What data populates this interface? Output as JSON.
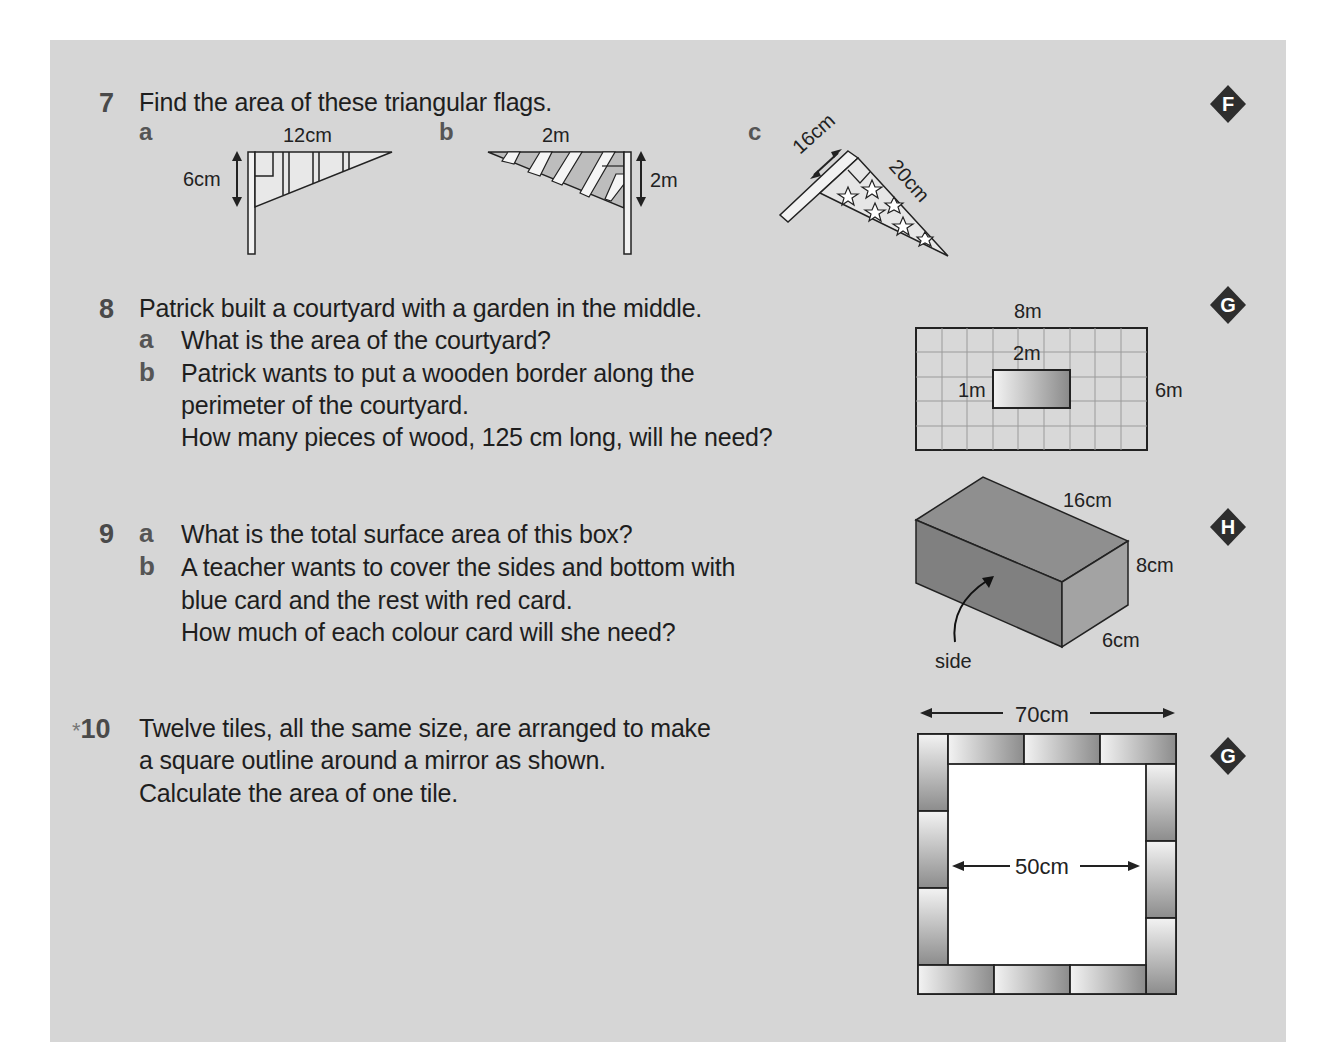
{
  "questions": {
    "q7": {
      "number": "7",
      "text": "Find the area of these triangular flags.",
      "difficulty": "F",
      "parts": {
        "a": {
          "label": "a",
          "width": "12cm",
          "height": "6cm"
        },
        "b": {
          "label": "b",
          "width": "2m",
          "height": "2m"
        },
        "c": {
          "label": "c",
          "side1": "16cm",
          "side2": "20cm"
        }
      }
    },
    "q8": {
      "number": "8",
      "text": "Patrick built a courtyard with a garden in the middle.",
      "difficulty": "G",
      "parts": [
        {
          "label": "a",
          "lines": [
            "What is the area of the courtyard?"
          ]
        },
        {
          "label": "b",
          "lines": [
            "Patrick wants to put a wooden border along the",
            "perimeter of the courtyard.",
            "How many pieces of wood, 125 cm long, will he need?"
          ]
        }
      ],
      "diagram": {
        "courtyard_width": "8m",
        "courtyard_height": "6m",
        "garden_width": "2m",
        "garden_height": "1m"
      }
    },
    "q9": {
      "number": "9",
      "difficulty": "H",
      "parts": [
        {
          "label": "a",
          "lines": [
            "What is the total surface area of this box?"
          ]
        },
        {
          "label": "b",
          "lines": [
            "A teacher wants to cover the sides and bottom with",
            "blue card and the rest with red card.",
            "How much of each colour card will she need?"
          ]
        }
      ],
      "diagram": {
        "length": "16cm",
        "height": "8cm",
        "depth": "6cm",
        "side_label": "side"
      }
    },
    "q10": {
      "number": "10",
      "star": "*",
      "difficulty": "G",
      "lines": [
        "Twelve tiles, all the same size, are arranged to make",
        "a square outline around a mirror as shown.",
        "Calculate the area of one tile."
      ],
      "diagram": {
        "outer": "70cm",
        "inner": "50cm"
      }
    }
  }
}
